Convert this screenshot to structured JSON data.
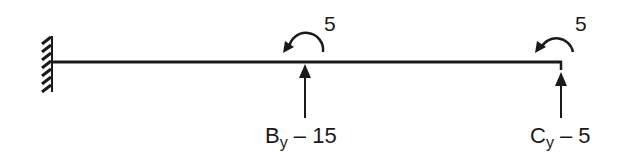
{
  "diagram": {
    "type": "beam-free-body",
    "colors": {
      "ink": "#1a1a1a",
      "background": "#ffffff"
    },
    "support": {
      "kind": "fixed-wall",
      "side": "left"
    },
    "beam": {
      "label": ""
    },
    "moments": [
      {
        "id": "B",
        "value": "5",
        "direction": "counterclockwise"
      },
      {
        "id": "C",
        "value": "5",
        "direction": "counterclockwise"
      }
    ],
    "reactions": [
      {
        "id": "B",
        "symbol": "B",
        "subscript": "y",
        "rest": " – 15",
        "direction": "up"
      },
      {
        "id": "C",
        "symbol": "C",
        "subscript": "y",
        "rest": " – 5",
        "direction": "up"
      }
    ]
  }
}
